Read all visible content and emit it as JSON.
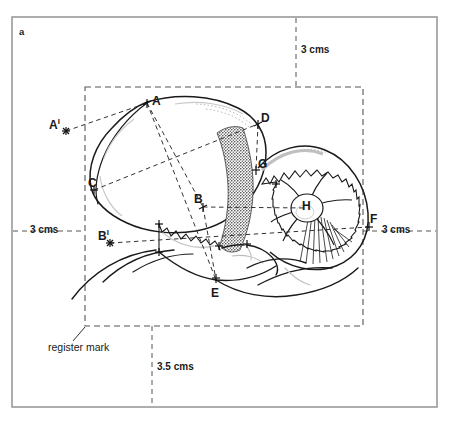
{
  "figure": {
    "panel_label": "a",
    "caption_note": "register mark"
  },
  "dimensions": [
    {
      "id": "top",
      "label": "3 cms"
    },
    {
      "id": "left",
      "label": "3 cms"
    },
    {
      "id": "right",
      "label": "3 cms"
    },
    {
      "id": "bottom",
      "label": "3.5 cms"
    }
  ],
  "landmarks": [
    {
      "id": "A",
      "label": "A",
      "prime": "",
      "x": 147,
      "y": 103,
      "lx": 154,
      "ly": 95
    },
    {
      "id": "Ap",
      "label": "A",
      "prime": "I",
      "x": 66,
      "y": 131,
      "lx": 50,
      "ly": 117
    },
    {
      "id": "B",
      "label": "B",
      "prime": "",
      "x": 203,
      "y": 207,
      "lx": 196,
      "ly": 194
    },
    {
      "id": "Bp",
      "label": "B",
      "prime": "I",
      "x": 110,
      "y": 243,
      "lx": 99,
      "ly": 229
    },
    {
      "id": "C",
      "label": "C",
      "prime": "",
      "x": 94,
      "y": 190,
      "lx": 90,
      "ly": 177
    },
    {
      "id": "D",
      "label": "D",
      "prime": "",
      "x": 258,
      "y": 124,
      "lx": 262,
      "ly": 112
    },
    {
      "id": "E",
      "label": "E",
      "prime": "",
      "x": 216,
      "y": 280,
      "lx": 212,
      "ly": 288
    },
    {
      "id": "F",
      "label": "F",
      "prime": "",
      "x": 369,
      "y": 227,
      "lx": 371,
      "ly": 214
    },
    {
      "id": "G",
      "label": "G",
      "prime": "",
      "x": 256,
      "y": 170,
      "lx": 259,
      "ly": 158
    },
    {
      "id": "H",
      "label": "H",
      "prime": "",
      "x": 307,
      "y": 208,
      "lx": 303,
      "ly": 200
    }
  ],
  "colors": {
    "frame": "#9a9a9a",
    "ink": "#1a1a1a",
    "dashed": "#555555",
    "stipple": "#3a3a3a"
  }
}
